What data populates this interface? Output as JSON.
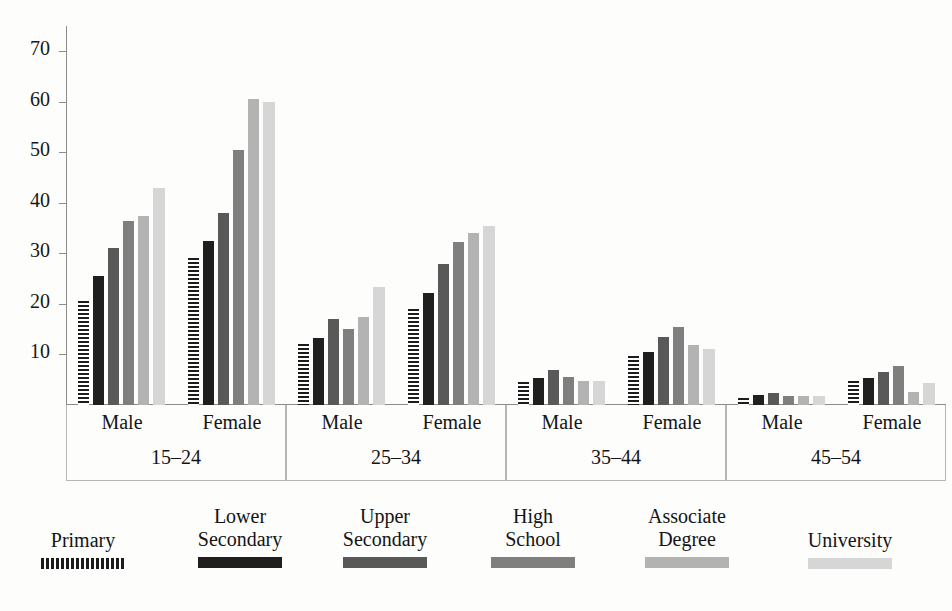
{
  "chart_data": {
    "type": "bar",
    "title": "",
    "xlabel": "",
    "ylabel": "",
    "ylim": [
      0,
      75
    ],
    "yticks": [
      10,
      20,
      30,
      40,
      50,
      60,
      70
    ],
    "grid": false,
    "legend_position": "bottom",
    "groups": [
      "15–24",
      "25–34",
      "35–44",
      "45–54"
    ],
    "subgroups": [
      "Male",
      "Female"
    ],
    "categories": [
      "15–24 Male",
      "15–24 Female",
      "25–34 Male",
      "25–34 Female",
      "35–44 Male",
      "35–44 Female",
      "45–54 Male",
      "45–54 Female"
    ],
    "series": [
      {
        "name": "Primary",
        "color": "#1c1c1c",
        "pattern": "horizontal-stripes",
        "values": [
          20.5,
          29.0,
          12.0,
          19.0,
          4.5,
          9.7,
          1.3,
          4.8
        ]
      },
      {
        "name": "Lower Secondary",
        "color": "#1f1f1f",
        "pattern": "solid",
        "values": [
          25.5,
          32.5,
          13.3,
          22.2,
          5.3,
          10.5,
          2.0,
          5.3
        ]
      },
      {
        "name": "Upper Secondary",
        "color": "#595959",
        "pattern": "solid",
        "values": [
          31.0,
          38.0,
          17.0,
          28.0,
          7.0,
          13.5,
          2.3,
          6.5
        ]
      },
      {
        "name": "High School",
        "color": "#7f7f7f",
        "pattern": "solid",
        "values": [
          36.5,
          50.5,
          15.0,
          32.3,
          5.5,
          15.5,
          1.8,
          7.7
        ]
      },
      {
        "name": "Associate Degree",
        "color": "#b3b3b3",
        "pattern": "solid",
        "values": [
          37.5,
          60.5,
          17.5,
          34.0,
          4.8,
          11.8,
          1.7,
          2.5
        ]
      },
      {
        "name": "University",
        "color": "#d6d6d6",
        "pattern": "solid",
        "values": [
          43.0,
          60.0,
          23.3,
          35.5,
          4.8,
          11.0,
          1.7,
          4.3
        ]
      }
    ]
  },
  "legend": {
    "items": [
      {
        "label": "Primary",
        "swatch": "legend-swatch-primary"
      },
      {
        "label": "Lower\nSecondary",
        "swatch": "legend-swatch-lower-secondary"
      },
      {
        "label": "Upper\nSecondary",
        "swatch": "legend-swatch-upper-secondary"
      },
      {
        "label": "High\nSchool",
        "swatch": "legend-swatch-high-school"
      },
      {
        "label": "Associate\nDegree",
        "swatch": "legend-swatch-associate-degree"
      },
      {
        "label": "University",
        "swatch": "legend-swatch-university"
      }
    ]
  }
}
